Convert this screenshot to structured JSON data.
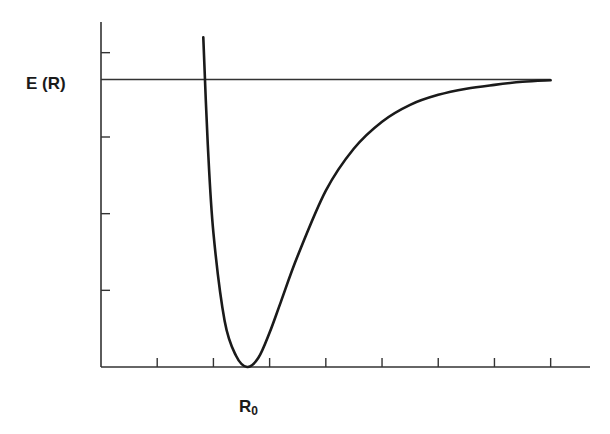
{
  "chart_data": {
    "type": "line",
    "title": "",
    "xlabel": "",
    "ylabel": "E (R)",
    "annotations": [
      {
        "text": "E (R)",
        "position": "left of asymptote line"
      },
      {
        "text": "R0",
        "sub": "0",
        "position": "below x-axis at curve minimum"
      }
    ],
    "xlim": [
      0,
      8.7
    ],
    "ylim": [
      0,
      4.5
    ],
    "x_ticks": [
      1,
      2,
      3,
      4,
      5,
      6,
      7,
      8
    ],
    "y_ticks": [
      1,
      2,
      3,
      4.1
    ],
    "tick_labels_shown": false,
    "grid": false,
    "legend": null,
    "asymptote": {
      "y": 3.75,
      "x_range": [
        0,
        8
      ]
    },
    "series": [
      {
        "name": "Potential energy curve (Morse-like)",
        "x": [
          1.82,
          1.9,
          2.0,
          2.2,
          2.4,
          2.6,
          2.8,
          3.0,
          3.2,
          3.5,
          4.0,
          4.5,
          5.0,
          5.5,
          6.0,
          6.5,
          7.0,
          7.5,
          8.0
        ],
        "y": [
          4.3,
          2.9,
          1.75,
          0.6,
          0.15,
          0.0,
          0.12,
          0.45,
          0.85,
          1.45,
          2.3,
          2.85,
          3.2,
          3.42,
          3.55,
          3.63,
          3.68,
          3.72,
          3.74
        ]
      }
    ],
    "minimum": {
      "x": 2.6,
      "y": 0.0,
      "label": "R0"
    }
  },
  "labels": {
    "energy": "E (R)",
    "r_main": "R",
    "r_sub": "0"
  },
  "colors": {
    "line": "#1a1a1a",
    "axis": "#333333",
    "background": "#ffffff"
  }
}
